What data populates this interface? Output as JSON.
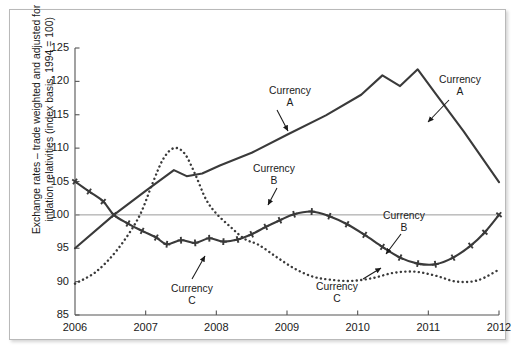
{
  "chart_data": {
    "type": "line",
    "title": "",
    "subtitle": "",
    "xlabel": "",
    "ylabel": "Exchange rates – trade weighted and adjusted for\ninflation relativities (index basis, 1994 = 100)",
    "xlim": [
      2006,
      2012
    ],
    "ylim": [
      85,
      125
    ],
    "xticks": [
      "2006",
      "2007",
      "2008",
      "2009",
      "2010",
      "2011",
      "2012"
    ],
    "yticks": [
      "85",
      "90",
      "95",
      "100",
      "105",
      "110",
      "115",
      "120",
      "125"
    ],
    "grid": false,
    "reference_line": {
      "value": 100,
      "label": "100"
    },
    "legend": "annotations",
    "series": [
      {
        "name": "Currency A",
        "style": "solid",
        "marker": "none",
        "color": "#3a3a3a",
        "x": [
          2006.0,
          2006.55,
          2007.0,
          2007.4,
          2007.58,
          2007.8,
          2008.05,
          2008.5,
          2009.0,
          2009.55,
          2010.05,
          2010.35,
          2010.6,
          2010.85,
          2011.1,
          2011.5,
          2012.0
        ],
        "y": [
          95.0,
          100.0,
          103.6,
          106.7,
          105.8,
          106.2,
          107.4,
          109.3,
          112.0,
          114.9,
          118.0,
          120.9,
          119.3,
          121.8,
          118.2,
          112.5,
          104.9
        ]
      },
      {
        "name": "Currency B",
        "style": "solid",
        "marker": "plus",
        "color": "#3a3a3a",
        "x": [
          2006.0,
          2006.2,
          2006.4,
          2006.55,
          2006.75,
          2006.95,
          2007.15,
          2007.3,
          2007.5,
          2007.7,
          2007.9,
          2008.1,
          2008.3,
          2008.5,
          2008.7,
          2008.9,
          2009.1,
          2009.35,
          2009.6,
          2009.85,
          2010.1,
          2010.35,
          2010.6,
          2010.85,
          2011.1,
          2011.35,
          2011.6,
          2011.8,
          2012.0
        ],
        "y": [
          105.0,
          103.5,
          102.0,
          100.0,
          98.7,
          97.6,
          96.6,
          95.6,
          96.2,
          95.8,
          96.5,
          96.0,
          96.3,
          97.1,
          98.2,
          99.2,
          100.1,
          100.5,
          99.8,
          98.6,
          97.0,
          95.2,
          93.6,
          92.7,
          92.6,
          93.6,
          95.4,
          97.4,
          100.0
        ]
      },
      {
        "name": "Currency C",
        "style": "dotted",
        "marker": "none",
        "color": "#3a3a3a",
        "x": [
          2006.0,
          2006.3,
          2006.6,
          2006.9,
          2007.1,
          2007.25,
          2007.4,
          2007.55,
          2007.7,
          2007.85,
          2008.0,
          2008.2,
          2008.4,
          2008.6,
          2008.85,
          2009.1,
          2009.35,
          2009.6,
          2009.9,
          2010.2,
          2010.5,
          2010.8,
          2011.1,
          2011.4,
          2011.7,
          2012.0
        ],
        "y": [
          89.7,
          91.5,
          94.8,
          99.6,
          104.8,
          108.4,
          110.0,
          109.2,
          106.1,
          102.4,
          100.2,
          98.2,
          96.4,
          95.5,
          93.7,
          92.0,
          90.8,
          90.3,
          90.1,
          90.5,
          91.3,
          91.5,
          90.9,
          90.0,
          90.2,
          91.8
        ]
      }
    ],
    "annotations": [
      {
        "name": "annotation-currency-a-left",
        "text": "Currency\nA",
        "label_x": 290,
        "label_y": 85,
        "tip_x": 288,
        "tip_y": 131,
        "from_x": 277,
        "from_y": 110
      },
      {
        "name": "annotation-currency-a-right",
        "text": "Currency\nA",
        "label_x": 460,
        "label_y": 74,
        "tip_x": 428,
        "tip_y": 122,
        "from_x": 449,
        "from_y": 100
      },
      {
        "name": "annotation-currency-b-left",
        "text": "Currency\nB",
        "label_x": 274,
        "label_y": 163,
        "tip_x": 268,
        "tip_y": 205,
        "from_x": 277,
        "from_y": 188
      },
      {
        "name": "annotation-currency-b-right",
        "text": "Currency\nB",
        "label_x": 404,
        "label_y": 210,
        "tip_x": 386,
        "tip_y": 254,
        "from_x": 401,
        "from_y": 234
      },
      {
        "name": "annotation-currency-c-left",
        "text": "Currency\nC",
        "label_x": 192,
        "label_y": 283,
        "tip_x": 205,
        "tip_y": 256,
        "from_x": 192,
        "from_y": 279
      },
      {
        "name": "annotation-currency-c-right",
        "text": "Currency\nC",
        "label_x": 337,
        "label_y": 281,
        "tip_x": 381,
        "tip_y": 268,
        "from_x": 363,
        "from_y": 279
      }
    ]
  }
}
